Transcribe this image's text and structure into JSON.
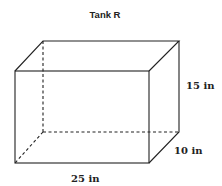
{
  "title": "Tank R",
  "shape": "rectangular prism",
  "dimensions": {
    "height": "15 in",
    "depth": "10 in",
    "length": "25 in"
  }
}
